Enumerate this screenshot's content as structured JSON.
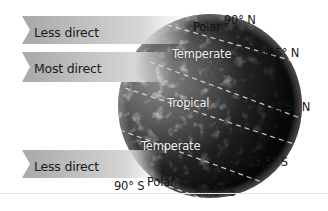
{
  "diagram": {
    "banners": [
      {
        "label": "Less direct",
        "position": "top"
      },
      {
        "label": "Most direct",
        "position": "middle"
      },
      {
        "label": "Less direct",
        "position": "bottom"
      }
    ],
    "zones": [
      {
        "label": "Polar",
        "hemisphere": "north"
      },
      {
        "label": "Temperate",
        "hemisphere": "north"
      },
      {
        "label": "Tropical",
        "hemisphere": "equator"
      },
      {
        "label": "Temperate",
        "hemisphere": "south"
      },
      {
        "label": "Polar",
        "hemisphere": "south"
      }
    ],
    "latitudes": [
      {
        "label": "90° N"
      },
      {
        "label": "66.5° N"
      },
      {
        "label": "23.5° N"
      },
      {
        "label": "0°"
      },
      {
        "label": "23.5° S"
      },
      {
        "label": "66.5° S"
      },
      {
        "label": "90° S"
      }
    ],
    "colors": {
      "banner_light": "#d9d9d9",
      "banner_dark": "#a6a6a6",
      "globe_dark": "#0a0a0a",
      "globe_light": "#9a9a9a",
      "dash_line": "#e8e8e8"
    }
  }
}
